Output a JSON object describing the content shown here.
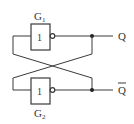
{
  "diagram": {
    "title": "",
    "gates": [
      {
        "id": "G1",
        "label_main": "G",
        "label_sub": "1",
        "symbol": "1",
        "type": "inverter"
      },
      {
        "id": "G2",
        "label_main": "G",
        "label_sub": "2",
        "symbol": "1",
        "type": "inverter"
      }
    ],
    "outputs": {
      "q": "Q",
      "q_bar": "Q"
    },
    "colors": {
      "line": "#3a3a3a",
      "text": "#333333",
      "background": "#ffffff"
    }
  }
}
